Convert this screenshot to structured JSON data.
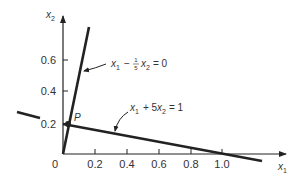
{
  "diagram": {
    "type": "linear-constraint-plot",
    "axes": {
      "x_label": "x",
      "x_label_sub": "1",
      "y_label": "x",
      "y_label_sub": "2",
      "origin_label": "0",
      "x_ticks": [
        "0.2",
        "0.4",
        "0.6",
        "0.8",
        "1.0"
      ],
      "y_ticks": [
        "0.2",
        "0.4",
        "0.6"
      ]
    },
    "lines": [
      {
        "name": "steep-line",
        "equation": {
          "v1": "x",
          "s1": "1",
          "op": "−",
          "frac_num": "1",
          "frac_den": "5",
          "v2": "x",
          "s2": "2",
          "rhs": "= 0"
        }
      },
      {
        "name": "shallow-line",
        "equation": {
          "v1": "x",
          "s1": "1",
          "op": "+ 5",
          "v2": "x",
          "s2": "2",
          "rhs": "= 1"
        }
      }
    ],
    "point": {
      "label": "P"
    },
    "colors": {
      "ink": "#222222",
      "text": "#333333",
      "background": "#ffffff"
    }
  }
}
